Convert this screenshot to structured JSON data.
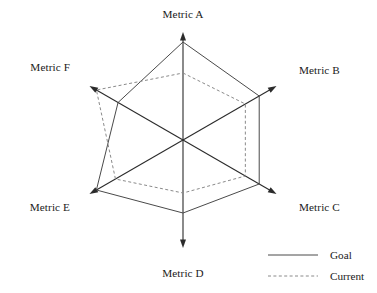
{
  "chart_data": {
    "type": "radar",
    "title": "",
    "categories": [
      "Metric A",
      "Metric B",
      "Metric C",
      "Metric D",
      "Metric E",
      "Metric F"
    ],
    "axis_angles_deg": [
      90,
      30,
      -30,
      -90,
      -150,
      150
    ],
    "axis_max": 100,
    "axis_max_radius_px": 108,
    "grid": false,
    "legend_position": "bottom-right",
    "series": [
      {
        "name": "Goal",
        "style": "solid",
        "color": "#4a4a4a",
        "values": [
          90,
          81,
          81,
          67,
          92,
          69
        ],
        "radii_px": [
          98,
          88,
          88,
          73,
          100,
          75
        ]
      },
      {
        "name": "Current",
        "style": "dashed",
        "color": "#8a8a8a",
        "values": [
          62,
          66,
          66,
          49,
          72,
          92
        ],
        "radii_px": [
          67,
          72,
          72,
          53,
          78,
          100
        ]
      }
    ]
  },
  "axes": {
    "labels": [
      {
        "name": "Metric A",
        "anchor": "middle",
        "x": 183,
        "y": 18
      },
      {
        "name": "Metric B",
        "anchor": "start",
        "x": 299,
        "y": 74
      },
      {
        "name": "Metric C",
        "anchor": "start",
        "x": 299,
        "y": 211
      },
      {
        "name": "Metric D",
        "anchor": "middle",
        "x": 183,
        "y": 277
      },
      {
        "name": "Metric E",
        "anchor": "end",
        "x": 70,
        "y": 211
      },
      {
        "name": "Metric F",
        "anchor": "end",
        "x": 70,
        "y": 71
      }
    ]
  },
  "legend": {
    "items": [
      {
        "label": "Goal",
        "style": "solid"
      },
      {
        "label": "Current",
        "style": "dashed"
      }
    ],
    "swatch_x1": 268,
    "swatch_x2": 318,
    "label_x": 330,
    "row_y": [
      255,
      276
    ]
  },
  "colors": {
    "background": "#ffffff",
    "axis": "#2b2b2b",
    "text": "#1a1a1a",
    "goal": "#4a4a4a",
    "current": "#8a8a8a"
  },
  "geometry": {
    "center_x": 183,
    "center_y": 140
  }
}
